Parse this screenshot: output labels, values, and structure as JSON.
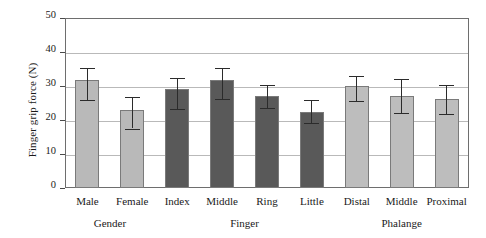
{
  "chart_data": {
    "type": "bar",
    "title": "",
    "xlabel": "",
    "ylabel": "Finger grip force (N)",
    "ylim": [
      0,
      50
    ],
    "ytick_values": [
      0,
      10,
      20,
      30,
      40,
      50
    ],
    "ytick_labels": [
      "0",
      "10",
      "20",
      "30",
      "40",
      "50"
    ],
    "grid": true,
    "legend": "none",
    "categories": [
      "Male",
      "Female",
      "Index",
      "Middle",
      "Ring",
      "Little",
      "Distal",
      "Middle",
      "Proximal"
    ],
    "values": [
      31.8,
      22.8,
      29.2,
      31.7,
      27.2,
      22.5,
      30.0,
      27.0,
      26.3
    ],
    "error_low": [
      26.0,
      17.5,
      23.2,
      26.2,
      23.4,
      19.2,
      25.6,
      22.0,
      21.7
    ],
    "error_high": [
      35.2,
      26.7,
      32.3,
      35.2,
      30.4,
      25.9,
      33.0,
      32.0,
      30.3
    ],
    "bar_colors": [
      "#b9b9b9",
      "#b9b9b9",
      "#595959",
      "#595959",
      "#595959",
      "#595959",
      "#bdbdbd",
      "#bdbdbd",
      "#bdbdbd"
    ],
    "groups": [
      {
        "label": "Gender",
        "start": 0,
        "count": 2
      },
      {
        "label": "Finger",
        "start": 2,
        "count": 4
      },
      {
        "label": "Phalange",
        "start": 6,
        "count": 3
      }
    ]
  },
  "colors": {
    "light_bar": "#b9b9b9",
    "dark_bar": "#595959",
    "gridline": "#b9b9b9",
    "frame": "#6e6e6e",
    "error_bar": "#2b2b2b",
    "text": "#1a1a1a",
    "background": "#ffffff"
  }
}
